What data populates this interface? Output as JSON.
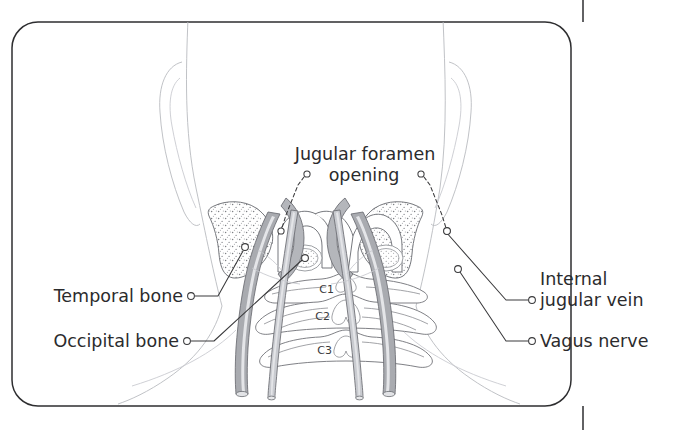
{
  "figure": {
    "orientation": "posterior view of skull base and cervical spine",
    "background_color": "#ffffff",
    "frame": {
      "stroke_color": "#2e2e30",
      "corner_radius": 26,
      "tick_x": 583
    }
  },
  "labels": {
    "jugular_foramen": {
      "line1": "Jugular foramen",
      "line2": "opening",
      "leader_style": "dashed",
      "sides": [
        "left",
        "right"
      ]
    },
    "temporal_bone": {
      "text": "Temporal bone",
      "side": "left",
      "leader_style": "solid"
    },
    "occipital_bone": {
      "text": "Occipital bone",
      "side": "left",
      "leader_style": "solid"
    },
    "internal_jugular_vein": {
      "line1": "Internal",
      "line2": "jugular vein",
      "side": "right",
      "leader_style": "solid"
    },
    "vagus_nerve": {
      "text": "Vagus nerve",
      "side": "right",
      "leader_style": "solid"
    }
  },
  "vertebrae": [
    {
      "id": "c1",
      "text": "C1"
    },
    {
      "id": "c2",
      "text": "C2"
    },
    {
      "id": "c3",
      "text": "C3"
    }
  ],
  "colors": {
    "text": "#2b2b2d",
    "leader": "#3a3a3c",
    "frame": "#2e2e30",
    "bone_outline": "#6f7176",
    "soft_outline": "#b9bbc0",
    "vein_fill": "#a9abb0",
    "nerve_fill": "#c9cbd0",
    "sinus_fill": "#b4b6bb"
  }
}
